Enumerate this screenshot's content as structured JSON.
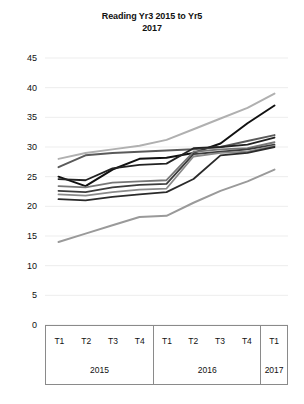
{
  "chart_data": {
    "type": "line",
    "title": "Reading Yr3 2015 to Yr5 2017",
    "title_line1": "Reading Yr3 2015 to Yr5",
    "title_line2": "2017",
    "xlabel": "",
    "ylabel": "",
    "ylim": [
      0,
      45
    ],
    "yticks": [
      45,
      40,
      35,
      30,
      25,
      20,
      15,
      10,
      5,
      0
    ],
    "grid": true,
    "legend": "none",
    "categories": [
      "T1",
      "T2",
      "T3",
      "T4",
      "T1",
      "T2",
      "T3",
      "T4",
      "T1"
    ],
    "category_groups": [
      {
        "label": "2015",
        "terms": [
          "T1",
          "T2",
          "T3",
          "T4"
        ],
        "span": 4
      },
      {
        "label": "2016",
        "terms": [
          "T1",
          "T2",
          "T3",
          "T4"
        ],
        "span": 4
      },
      {
        "label": "2017",
        "terms": [
          "T1"
        ],
        "span": 1
      }
    ],
    "series": [
      {
        "name": "Series 1",
        "color": "#b0b0b0",
        "width": 2.0,
        "values": [
          28.0,
          29.0,
          29.6,
          30.2,
          31.2,
          33.0,
          34.8,
          36.6,
          39.0
        ]
      },
      {
        "name": "Series 2",
        "color": "#111111",
        "width": 2.0,
        "values": [
          25.0,
          23.4,
          26.2,
          28.0,
          28.2,
          29.0,
          30.6,
          34.0,
          37.0
        ]
      },
      {
        "name": "Series 3",
        "color": "#5a5a5a",
        "width": 2.0,
        "values": [
          26.6,
          28.6,
          29.0,
          29.2,
          29.4,
          29.6,
          30.0,
          31.0,
          32.0
        ]
      },
      {
        "name": "Series 4",
        "color": "#222222",
        "width": 1.8,
        "values": [
          24.6,
          24.4,
          26.4,
          27.0,
          27.2,
          29.8,
          30.0,
          30.4,
          31.6
        ]
      },
      {
        "name": "Series 5",
        "color": "#777777",
        "width": 1.8,
        "values": [
          23.4,
          23.2,
          24.0,
          24.2,
          24.4,
          29.2,
          29.6,
          29.8,
          30.8
        ]
      },
      {
        "name": "Series 6",
        "color": "#3c3c3c",
        "width": 1.8,
        "values": [
          22.6,
          22.4,
          23.2,
          23.6,
          23.8,
          28.8,
          29.2,
          29.6,
          30.4
        ]
      },
      {
        "name": "Series 7",
        "color": "#8a8a8a",
        "width": 1.8,
        "values": [
          22.0,
          21.8,
          22.4,
          22.8,
          23.0,
          28.4,
          29.0,
          29.2,
          30.2
        ]
      },
      {
        "name": "Series 8",
        "color": "#2a2a2a",
        "width": 1.8,
        "values": [
          21.2,
          21.0,
          21.6,
          22.0,
          22.4,
          24.6,
          28.6,
          29.0,
          30.0
        ]
      },
      {
        "name": "Series 9",
        "color": "#9a9a9a",
        "width": 2.0,
        "values": [
          14.0,
          15.4,
          16.8,
          18.2,
          18.4,
          20.6,
          22.6,
          24.2,
          26.2
        ]
      }
    ]
  }
}
